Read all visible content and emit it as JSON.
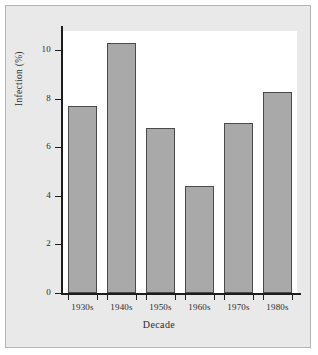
{
  "chart_data": {
    "type": "bar",
    "title": "",
    "xlabel": "Decade",
    "ylabel": "Infection (%)",
    "categories": [
      "1930s",
      "1940s",
      "1950s",
      "1960s",
      "1970s",
      "1980s"
    ],
    "values": [
      7.7,
      10.3,
      6.8,
      4.4,
      7.0,
      8.3
    ],
    "ylim": [
      0,
      10.8
    ],
    "yticks": [
      0,
      2,
      4,
      6,
      8,
      10
    ],
    "ytick_labels": [
      "0",
      "2",
      "4",
      "6",
      "8",
      "10"
    ],
    "grid": false,
    "legend": null,
    "bar_color": "#a9a9a9",
    "bar_edge_color": "#4a4a4a",
    "axis_color": "#1d1d1d",
    "plot_background": "#ffffff",
    "figure_background": "#e9e9e9",
    "frame_border_color": "#b4b4b4"
  }
}
